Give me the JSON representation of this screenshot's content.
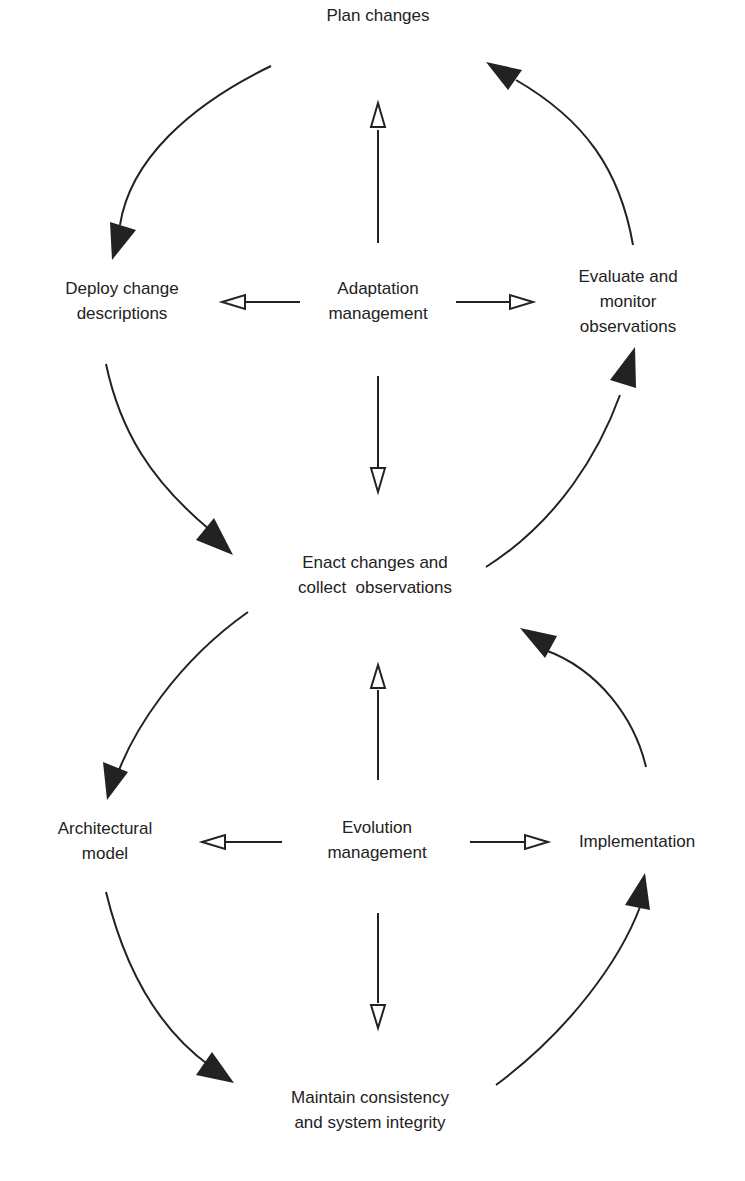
{
  "diagram": {
    "type": "two-cycle process diagram",
    "colors": {
      "stroke": "#222222",
      "text": "#222222",
      "background": "#ffffff"
    },
    "upper_cycle": {
      "center": {
        "id": "adaptation",
        "lines": [
          "Adaptation",
          "management"
        ]
      },
      "nodes": [
        {
          "id": "plan",
          "lines": [
            "Plan changes"
          ]
        },
        {
          "id": "deploy",
          "lines": [
            "Deploy change",
            "descriptions"
          ]
        },
        {
          "id": "enact",
          "lines": [
            "Enact changes and",
            "collect  observations"
          ]
        },
        {
          "id": "evaluate",
          "lines": [
            "Evaluate and",
            "monitor",
            "observations"
          ]
        }
      ],
      "cycle_edges": [
        {
          "from": "plan",
          "to": "deploy"
        },
        {
          "from": "deploy",
          "to": "enact"
        },
        {
          "from": "enact",
          "to": "evaluate"
        },
        {
          "from": "evaluate",
          "to": "plan"
        }
      ],
      "control_edges": [
        {
          "from": "adaptation",
          "to": "plan"
        },
        {
          "from": "adaptation",
          "to": "deploy"
        },
        {
          "from": "adaptation",
          "to": "enact"
        },
        {
          "from": "adaptation",
          "to": "evaluate"
        }
      ]
    },
    "lower_cycle": {
      "center": {
        "id": "evolution",
        "lines": [
          "Evolution",
          "management"
        ]
      },
      "nodes": [
        {
          "id": "enact",
          "lines": [
            "Enact changes and",
            "collect  observations"
          ]
        },
        {
          "id": "architectural",
          "lines": [
            "Architectural",
            "model"
          ]
        },
        {
          "id": "maintain",
          "lines": [
            "Maintain consistency",
            "and system integrity"
          ]
        },
        {
          "id": "implementation",
          "lines": [
            "Implementation"
          ]
        }
      ],
      "cycle_edges": [
        {
          "from": "enact",
          "to": "architectural"
        },
        {
          "from": "architectural",
          "to": "maintain"
        },
        {
          "from": "maintain",
          "to": "implementation"
        },
        {
          "from": "implementation",
          "to": "enact"
        }
      ],
      "control_edges": [
        {
          "from": "evolution",
          "to": "enact"
        },
        {
          "from": "evolution",
          "to": "architectural"
        },
        {
          "from": "evolution",
          "to": "maintain"
        },
        {
          "from": "evolution",
          "to": "implementation"
        }
      ]
    }
  },
  "labels": {
    "plan": [
      "Plan changes"
    ],
    "deploy": [
      "Deploy change",
      "descriptions"
    ],
    "adaptation": [
      "Adaptation",
      "management"
    ],
    "evaluate": [
      "Evaluate and",
      "monitor",
      "observations"
    ],
    "enact": [
      "Enact changes and",
      "collect  observations"
    ],
    "architectural": [
      "Architectural",
      "model"
    ],
    "evolution": [
      "Evolution",
      "management"
    ],
    "implementation": [
      "Implementation"
    ],
    "maintain": [
      "Maintain consistency",
      "and system integrity"
    ]
  }
}
